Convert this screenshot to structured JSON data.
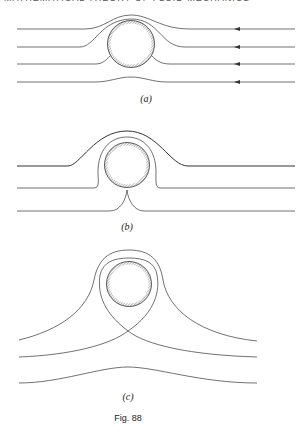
{
  "page": {
    "running_head": "MATHEMATICAL THEORY OF FLUID MECHANICS",
    "caption": "Fig. 88"
  },
  "panels": [
    {
      "id": "a",
      "label": "(a)",
      "description": "Streamlines of uniform flow past a circular cylinder, flow from right to left"
    },
    {
      "id": "b",
      "label": "(b)",
      "description": "Streamlines past a cylinder with circulation, stagnation point on lower surface"
    },
    {
      "id": "c",
      "label": "(c)",
      "description": "Streamlines past a cylinder with strong circulation, stagnation point detached below cylinder"
    }
  ],
  "colors": {
    "ink": "#333333",
    "hatch": "#888888"
  }
}
